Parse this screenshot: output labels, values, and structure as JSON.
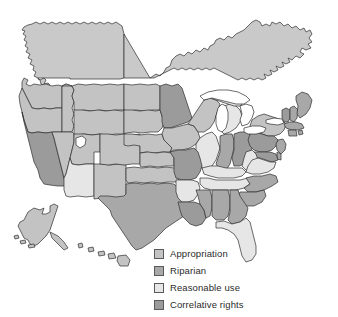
{
  "figure": {
    "name": "us-water-rights-doctrine-map",
    "background_color": "#ffffff",
    "border_color": "#2e2e2e"
  },
  "legend": {
    "position": "bottom-right",
    "items": [
      {
        "label": "Appropriation",
        "color": "#c3c3c3",
        "key": "appropriation"
      },
      {
        "label": "Riparian",
        "color": "#a8a8a8",
        "key": "riparian"
      },
      {
        "label": "Reasonable use",
        "color": "#e6e6e6",
        "key": "reasonable-use"
      },
      {
        "label": "Correlative rights",
        "color": "#9b9b9b",
        "key": "correlative-rights"
      }
    ]
  },
  "map_data": {
    "type": "choropleth",
    "region": "United States",
    "categories": [
      "Appropriation",
      "Riparian",
      "Reasonable use",
      "Correlative rights"
    ],
    "colors": {
      "Appropriation": "#c3c3c3",
      "Riparian": "#a8a8a8",
      "Reasonable use": "#e6e6e6",
      "Correlative rights": "#9b9b9b",
      "water": "#ffffff",
      "canada": "#c9c9c9",
      "outline": "#2e2e2e"
    },
    "insets": [
      "Alaska",
      "Hawaii"
    ],
    "unfilled_features": [
      "Great Lakes",
      "Great Salt Lake"
    ],
    "states": [
      {
        "name": "Washington",
        "abbr": "WA",
        "category": "Appropriation"
      },
      {
        "name": "Oregon",
        "abbr": "OR",
        "category": "Appropriation"
      },
      {
        "name": "Idaho",
        "abbr": "ID",
        "category": "Appropriation"
      },
      {
        "name": "Montana",
        "abbr": "MT",
        "category": "Appropriation"
      },
      {
        "name": "Wyoming",
        "abbr": "WY",
        "category": "Appropriation"
      },
      {
        "name": "North Dakota",
        "abbr": "ND",
        "category": "Appropriation"
      },
      {
        "name": "South Dakota",
        "abbr": "SD",
        "category": "Appropriation"
      },
      {
        "name": "Nebraska",
        "abbr": "NE",
        "category": "Appropriation"
      },
      {
        "name": "Minnesota",
        "abbr": "MN",
        "category": "Correlative rights"
      },
      {
        "name": "Iowa",
        "abbr": "IA",
        "category": "Appropriation"
      },
      {
        "name": "Wisconsin",
        "abbr": "WI",
        "category": "Appropriation"
      },
      {
        "name": "California",
        "abbr": "CA",
        "category": "Correlative rights"
      },
      {
        "name": "Nevada",
        "abbr": "NV",
        "category": "Appropriation"
      },
      {
        "name": "Utah",
        "abbr": "UT",
        "category": "Appropriation"
      },
      {
        "name": "Colorado",
        "abbr": "CO",
        "category": "Appropriation"
      },
      {
        "name": "Kansas",
        "abbr": "KS",
        "category": "Appropriation"
      },
      {
        "name": "Missouri",
        "abbr": "MO",
        "category": "Correlative rights"
      },
      {
        "name": "Illinois",
        "abbr": "IL",
        "category": "Reasonable use"
      },
      {
        "name": "Indiana",
        "abbr": "IN",
        "category": "Riparian"
      },
      {
        "name": "Ohio",
        "abbr": "OH",
        "category": "Correlative rights"
      },
      {
        "name": "Michigan",
        "abbr": "MI",
        "category": "Reasonable use"
      },
      {
        "name": "Pennsylvania",
        "abbr": "PA",
        "category": "Correlative rights"
      },
      {
        "name": "New York",
        "abbr": "NY",
        "category": "Appropriation"
      },
      {
        "name": "Vermont",
        "abbr": "VT",
        "category": "Correlative rights"
      },
      {
        "name": "New Hampshire",
        "abbr": "NH",
        "category": "Riparian"
      },
      {
        "name": "Maine",
        "abbr": "ME",
        "category": "Riparian"
      },
      {
        "name": "Massachusetts",
        "abbr": "MA",
        "category": "Riparian"
      },
      {
        "name": "Rhode Island",
        "abbr": "RI",
        "category": "Riparian"
      },
      {
        "name": "Connecticut",
        "abbr": "CT",
        "category": "Riparian"
      },
      {
        "name": "New Jersey",
        "abbr": "NJ",
        "category": "Riparian"
      },
      {
        "name": "Delaware",
        "abbr": "DE",
        "category": "Riparian"
      },
      {
        "name": "Maryland",
        "abbr": "MD",
        "category": "Correlative rights"
      },
      {
        "name": "West Virginia",
        "abbr": "WV",
        "category": "Reasonable use"
      },
      {
        "name": "Virginia",
        "abbr": "VA",
        "category": "Reasonable use"
      },
      {
        "name": "Kentucky",
        "abbr": "KY",
        "category": "Reasonable use"
      },
      {
        "name": "Tennessee",
        "abbr": "TN",
        "category": "Reasonable use"
      },
      {
        "name": "North Carolina",
        "abbr": "NC",
        "category": "Riparian"
      },
      {
        "name": "South Carolina",
        "abbr": "SC",
        "category": "Riparian"
      },
      {
        "name": "Georgia",
        "abbr": "GA",
        "category": "Riparian"
      },
      {
        "name": "Florida",
        "abbr": "FL",
        "category": "Reasonable use"
      },
      {
        "name": "Alabama",
        "abbr": "AL",
        "category": "Riparian"
      },
      {
        "name": "Mississippi",
        "abbr": "MS",
        "category": "Riparian"
      },
      {
        "name": "Arkansas",
        "abbr": "AR",
        "category": "Reasonable use"
      },
      {
        "name": "Louisiana",
        "abbr": "LA",
        "category": "Correlative rights"
      },
      {
        "name": "Oklahoma",
        "abbr": "OK",
        "category": "Appropriation"
      },
      {
        "name": "Texas",
        "abbr": "TX",
        "category": "Riparian"
      },
      {
        "name": "New Mexico",
        "abbr": "NM",
        "category": "Appropriation"
      },
      {
        "name": "Arizona",
        "abbr": "AZ",
        "category": "Reasonable use"
      },
      {
        "name": "Alaska",
        "abbr": "AK",
        "category": "Appropriation"
      },
      {
        "name": "Hawaii",
        "abbr": "HI",
        "category": "Appropriation"
      }
    ]
  }
}
